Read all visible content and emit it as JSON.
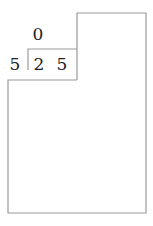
{
  "diagram": {
    "type": "division-layout",
    "top_digit": "0",
    "row_digits": [
      "5",
      "2",
      "5"
    ],
    "line_color": "#9a9a9a",
    "text_color": "#222222"
  }
}
